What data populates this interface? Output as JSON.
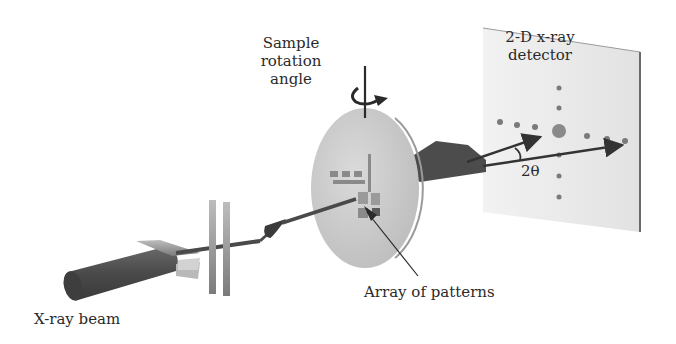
{
  "diagram": {
    "labels": {
      "sample_rotation": "Sample\nrotation\nangle",
      "detector": "2-D x-ray\ndetector",
      "two_theta": "2θ",
      "array_of_patterns": "Array of patterns",
      "xray_beam": "X-ray beam"
    },
    "components": [
      {
        "id": "xray-source",
        "kind": "cylinder",
        "label": "X-ray beam"
      },
      {
        "id": "slits-horizontal",
        "kind": "slit-pair"
      },
      {
        "id": "slits-vertical",
        "kind": "slit-pair"
      },
      {
        "id": "sample-disk",
        "kind": "disk",
        "label": "Array of patterns"
      },
      {
        "id": "diffracted-cone",
        "kind": "wedge"
      },
      {
        "id": "detector-plate",
        "kind": "plate",
        "label": "2-D x-ray detector"
      }
    ],
    "colors": {
      "background": "#ffffff",
      "beam_dark": "#4a4a4a",
      "disk_fill": "#cfcfcf",
      "detector_fill": "#ececec",
      "spot": "#7a7a7a",
      "text": "#2a2a2a"
    }
  }
}
